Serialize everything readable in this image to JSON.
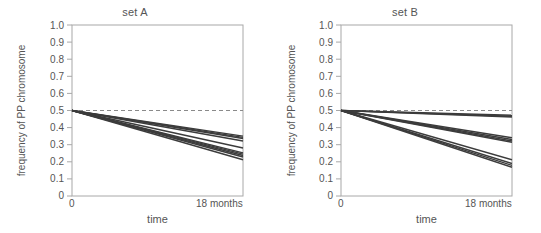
{
  "figure": {
    "background": "#ffffff",
    "line_color": "#3c3c3c",
    "ref_line_color": "#8a8a8a",
    "axis_color": "#9a9a9a",
    "text_color": "#555555"
  },
  "chart_data": [
    {
      "type": "line",
      "title": "set A",
      "xlabel": "time",
      "ylabel": "frequency of PP chromosome",
      "xlim": [
        0,
        18
      ],
      "ylim": [
        0,
        1.0
      ],
      "x_tick_labels": [
        "0",
        "18 months"
      ],
      "x_tick_values": [
        0,
        18
      ],
      "ytick_labels": [
        "0",
        "0.1",
        "0.2",
        "0.3",
        "0.4",
        "0.5",
        "0.6",
        "0.7",
        "0.8",
        "0.9",
        "1.0"
      ],
      "ytick_values": [
        0,
        0.1,
        0.2,
        0.3,
        0.4,
        0.5,
        0.6,
        0.7,
        0.8,
        0.9,
        1.0
      ],
      "grid": false,
      "legend": "none",
      "reference_line": {
        "y": 0.5,
        "style": "dashed",
        "label": "0.5"
      },
      "x": [
        0,
        18
      ],
      "series": [
        {
          "name": "A1",
          "values": [
            0.5,
            0.35
          ]
        },
        {
          "name": "A2",
          "values": [
            0.5,
            0.343
          ]
        },
        {
          "name": "A3",
          "values": [
            0.5,
            0.336
          ]
        },
        {
          "name": "A4",
          "values": [
            0.5,
            0.322
          ]
        },
        {
          "name": "A5",
          "values": [
            0.5,
            0.281
          ]
        },
        {
          "name": "A6",
          "values": [
            0.5,
            0.252
          ]
        },
        {
          "name": "A7",
          "values": [
            0.5,
            0.245
          ]
        },
        {
          "name": "A8",
          "values": [
            0.5,
            0.237
          ]
        },
        {
          "name": "A9",
          "values": [
            0.5,
            0.228
          ]
        },
        {
          "name": "A10",
          "values": [
            0.5,
            0.212
          ]
        }
      ]
    },
    {
      "type": "line",
      "title": "set B",
      "xlabel": "time",
      "ylabel": "frequency of PP chromosome",
      "xlim": [
        0,
        18
      ],
      "ylim": [
        0,
        1.0
      ],
      "x_tick_labels": [
        "0",
        "18 months"
      ],
      "x_tick_values": [
        0,
        18
      ],
      "ytick_labels": [
        "0",
        "0.1",
        "0.2",
        "0.3",
        "0.4",
        "0.5",
        "0.6",
        "0.7",
        "0.8",
        "0.9",
        "1.0"
      ],
      "ytick_values": [
        0,
        0.1,
        0.2,
        0.3,
        0.4,
        0.5,
        0.6,
        0.7,
        0.8,
        0.9,
        1.0
      ],
      "grid": false,
      "legend": "none",
      "reference_line": {
        "y": 0.5,
        "style": "dashed",
        "label": "0.5"
      },
      "x": [
        0,
        18
      ],
      "series": [
        {
          "name": "B1",
          "values": [
            0.5,
            0.472
          ]
        },
        {
          "name": "B2",
          "values": [
            0.5,
            0.466
          ]
        },
        {
          "name": "B3",
          "values": [
            0.5,
            0.462
          ]
        },
        {
          "name": "B4",
          "values": [
            0.5,
            0.341
          ]
        },
        {
          "name": "B5",
          "values": [
            0.5,
            0.33
          ]
        },
        {
          "name": "B6",
          "values": [
            0.5,
            0.322
          ]
        },
        {
          "name": "B7",
          "values": [
            0.5,
            0.314
          ]
        },
        {
          "name": "B8",
          "values": [
            0.5,
            0.212
          ]
        },
        {
          "name": "B9",
          "values": [
            0.5,
            0.19
          ]
        },
        {
          "name": "B10",
          "values": [
            0.5,
            0.179
          ]
        },
        {
          "name": "B11",
          "values": [
            0.5,
            0.168
          ]
        }
      ]
    }
  ],
  "panels": [
    {
      "title": "set A",
      "ylabel": "frequency of PP chromosome",
      "xlabel": "time",
      "x_start_label": "0",
      "x_end_label": "18 months"
    },
    {
      "title": "set B",
      "ylabel": "frequency of PP chromosome",
      "xlabel": "time",
      "x_start_label": "0",
      "x_end_label": "18 months"
    }
  ]
}
